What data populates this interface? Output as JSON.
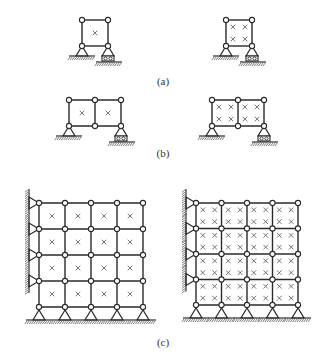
{
  "figure": {
    "colors": {
      "stroke": "#2a2a2a",
      "cross": "#555555",
      "background": "#ffffff"
    },
    "panels": [
      {
        "id": "a",
        "label": "(a)",
        "label_pos": [
          163,
          75
        ],
        "diagrams": [
          {
            "x0": 82,
            "y0": 20,
            "cols": 1,
            "rows": 1,
            "cell": 26,
            "crosses_per_cell": 1,
            "supports": [
              {
                "node": [
                  0,
                  1
                ],
                "type": "pin"
              },
              {
                "node": [
                  1,
                  1
                ],
                "type": "roller"
              }
            ],
            "wall": false
          },
          {
            "x0": 226,
            "y0": 20,
            "cols": 1,
            "rows": 1,
            "cell": 26,
            "crosses_per_cell": 4,
            "supports": [
              {
                "node": [
                  0,
                  1
                ],
                "type": "pin"
              },
              {
                "node": [
                  1,
                  1
                ],
                "type": "roller"
              }
            ],
            "wall": false
          }
        ]
      },
      {
        "id": "b",
        "label": "(b)",
        "label_pos": [
          163,
          147
        ],
        "diagrams": [
          {
            "x0": 69,
            "y0": 100,
            "cols": 2,
            "rows": 1,
            "cell": 26,
            "crosses_per_cell": 1,
            "supports": [
              {
                "node": [
                  0,
                  1
                ],
                "type": "pin"
              },
              {
                "node": [
                  2,
                  1
                ],
                "type": "roller"
              }
            ],
            "wall": false
          },
          {
            "x0": 212,
            "y0": 100,
            "cols": 2,
            "rows": 1,
            "cell": 26,
            "crosses_per_cell": 4,
            "supports": [
              {
                "node": [
                  0,
                  1
                ],
                "type": "pin"
              },
              {
                "node": [
                  2,
                  1
                ],
                "type": "roller"
              }
            ],
            "wall": false
          }
        ]
      },
      {
        "id": "c",
        "label": "(c)",
        "label_pos": [
          163,
          336
        ],
        "diagrams": [
          {
            "x0": 39,
            "y0": 203,
            "cols": 4,
            "rows": 4,
            "cell": 26,
            "crosses_per_cell": 1,
            "supports": "all-bottom-pins",
            "wall": true
          },
          {
            "x0": 196,
            "y0": 203,
            "cols": 4,
            "rows": 4,
            "cell": 25.5,
            "crosses_per_cell": 4,
            "supports": "all-bottom-pins",
            "wall": true
          }
        ]
      }
    ]
  }
}
